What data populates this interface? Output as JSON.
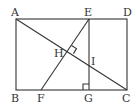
{
  "diagram": {
    "points": {
      "A": {
        "label": "A",
        "x": 16,
        "y": 19
      },
      "B": {
        "label": "B",
        "x": 16,
        "y": 90
      },
      "C": {
        "label": "C",
        "x": 127,
        "y": 90
      },
      "D": {
        "label": "D",
        "x": 127,
        "y": 19
      },
      "E": {
        "label": "E",
        "x": 89,
        "y": 19
      },
      "F": {
        "label": "F",
        "x": 41,
        "y": 90
      },
      "G": {
        "label": "G",
        "x": 89,
        "y": 90
      },
      "H": {
        "label": "H",
        "x": 68,
        "y": 50
      },
      "I": {
        "label": "I",
        "x": 89,
        "y": 67
      }
    },
    "segments": [
      "AD",
      "DC",
      "CB",
      "BA",
      "EG",
      "AC",
      "EF"
    ],
    "right_angles": [
      "H (EF ⟂ AC)",
      "G (EG ⟂ BC)"
    ],
    "colors": {
      "stroke": "#333333",
      "background": "#ffffff"
    }
  }
}
